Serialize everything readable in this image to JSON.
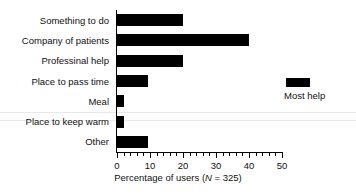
{
  "chart_data": {
    "type": "bar",
    "orientation": "horizontal",
    "title": "",
    "subtitle": "",
    "xlabel": "Percentage of users (N = 325)",
    "xlabel_parts": {
      "before": "Percentage of users (",
      "italic": "N",
      "after": " = 325)"
    },
    "ylabel": "",
    "categories": [
      "Something to do",
      "Company of patients",
      "Professinal help",
      "Place to pass time",
      "Meal",
      "Place to keep warm",
      "Other"
    ],
    "values": [
      20,
      40,
      20,
      9.5,
      2,
      2,
      9.5
    ],
    "series": [
      {
        "name": "Most help",
        "color": "#000000",
        "values": [
          20,
          40,
          20,
          9.5,
          2,
          2,
          9.5
        ]
      }
    ],
    "xlim": [
      0,
      50
    ],
    "xticks": [
      0,
      10,
      20,
      30,
      40,
      50
    ],
    "xtick_labels": [
      "0",
      "10",
      "20",
      "30",
      "40",
      "50"
    ],
    "x_minor_tick_interval": 2,
    "grid": false,
    "legend": {
      "position": "right",
      "entries": [
        {
          "label": "Most help",
          "color": "#000000"
        }
      ]
    },
    "bar_color": "#000000",
    "axis_color": "#000000",
    "background": "#ffffff"
  }
}
